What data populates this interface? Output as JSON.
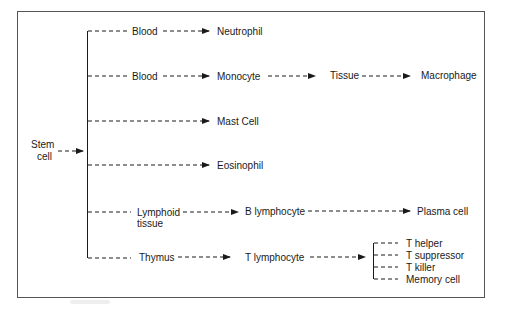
{
  "diagram": {
    "type": "flow",
    "root": {
      "line1": "Stem",
      "line2": "cell"
    },
    "rows": [
      {
        "nodes": [
          "Blood",
          "Neutrophil"
        ]
      },
      {
        "nodes": [
          "Blood",
          "Monocyte",
          "Tissue",
          "Macrophage"
        ]
      },
      {
        "nodes": [
          "Mast Cell"
        ]
      },
      {
        "nodes": [
          "Eosinophil"
        ]
      },
      {
        "nodes": [
          "Lymphoid tissue",
          "B lymphocyte",
          "Plasma cell"
        ],
        "lymphoid_line1": "Lymphoid",
        "lymphoid_line2": "tissue"
      },
      {
        "nodes": [
          "Thymus",
          "T lymphocyte"
        ],
        "branches": [
          "T helper",
          "T suppressor",
          "T killer",
          "Memory cell"
        ]
      }
    ]
  },
  "labels": {
    "stem1": "Stem",
    "stem2": "cell",
    "blood1": "Blood",
    "neutrophil": "Neutrophil",
    "blood2": "Blood",
    "monocyte": "Monocyte",
    "tissue": "Tissue",
    "macrophage": "Macrophage",
    "mast": "Mast Cell",
    "eosinophil": "Eosinophil",
    "lymphoid1": "Lymphoid",
    "lymphoid2": "tissue",
    "blymph": "B lymphocyte",
    "plasma": "Plasma cell",
    "thymus": "Thymus",
    "tlymph": "T lymphocyte",
    "thelper": "T helper",
    "tsupp": "T suppressor",
    "tkiller": "T killer",
    "memory": "Memory cell"
  },
  "colors": {
    "line": "#1a1a1a",
    "frame": "#555555",
    "background": "#ffffff"
  }
}
